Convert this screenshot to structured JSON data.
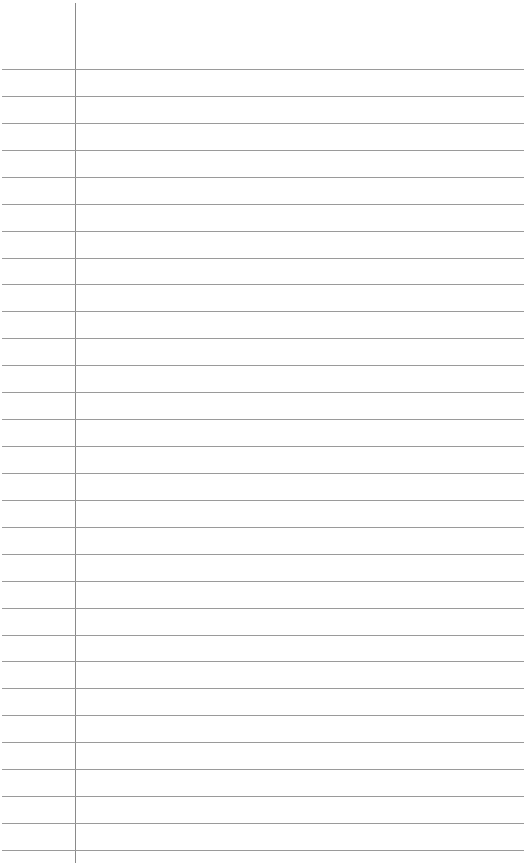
{
  "page": {
    "type": "lined-paper",
    "background_color": "#ffffff",
    "line_color": "#9a9a9a",
    "margin_line_color": "#8a8a8a",
    "margin_x": 75,
    "first_line_y": 69,
    "line_spacing": 26.93,
    "line_count": 30
  }
}
